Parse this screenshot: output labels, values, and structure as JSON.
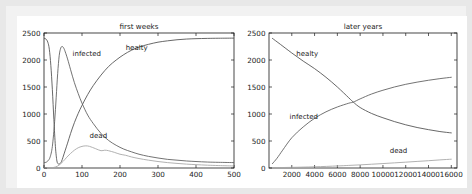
{
  "figure": {
    "background": "#e8e8e8",
    "frame_color": "#f2f2f2",
    "plot_background": "#ffffff"
  },
  "panels": [
    {
      "id": "first-weeks",
      "title": "first weeks",
      "xticks": [
        "0",
        "100",
        "200",
        "300",
        "400",
        "500"
      ],
      "yticks": [
        "0",
        "500",
        "1000",
        "1500",
        "2000",
        "2500"
      ],
      "labels": {
        "healthy": "healty",
        "infected": "infected",
        "dead": "dead"
      }
    },
    {
      "id": "later-years",
      "title": "later years",
      "xticks": [
        "2000",
        "4000",
        "6000",
        "8000",
        "10000",
        "12000",
        "14000",
        "16000"
      ],
      "yticks": [
        "0",
        "500",
        "1000",
        "1500",
        "2000",
        "2500"
      ],
      "labels": {
        "healthy": "healty",
        "infected": "infected",
        "dead": "dead"
      }
    }
  ],
  "chart_data": [
    {
      "type": "line",
      "title": "first weeks",
      "xlabel": "",
      "ylabel": "",
      "xlim": [
        0,
        500
      ],
      "ylim": [
        0,
        2500
      ],
      "grid": false,
      "legend": "inline annotations",
      "xticks": [
        0,
        100,
        200,
        300,
        400,
        500
      ],
      "yticks": [
        0,
        500,
        1000,
        1500,
        2000,
        2500
      ],
      "annotations": [
        {
          "text": "infected",
          "x": 75,
          "y": 2080
        },
        {
          "text": "healty",
          "x": 215,
          "y": 2180
        },
        {
          "text": "dead",
          "x": 120,
          "y": 560
        }
      ],
      "series": [
        {
          "name": "healty",
          "color": "#4d4d4d",
          "x": [
            0,
            5,
            10,
            14,
            18,
            22,
            26,
            30,
            34,
            38,
            42,
            46,
            50,
            56,
            62,
            70,
            80,
            90,
            100,
            115,
            130,
            150,
            170,
            190,
            210,
            230,
            250,
            275,
            300,
            325,
            350,
            375,
            400,
            430,
            460,
            500
          ],
          "y": [
            2400,
            2390,
            2330,
            2200,
            1900,
            1450,
            900,
            400,
            130,
            75,
            80,
            120,
            200,
            330,
            460,
            640,
            840,
            1010,
            1160,
            1360,
            1530,
            1720,
            1880,
            2000,
            2100,
            2180,
            2240,
            2290,
            2330,
            2355,
            2375,
            2388,
            2395,
            2400,
            2403,
            2405
          ]
        },
        {
          "name": "infected",
          "color": "#5a5a5a",
          "x": [
            0,
            5,
            10,
            16,
            22,
            28,
            32,
            36,
            40,
            44,
            48,
            52,
            56,
            62,
            70,
            80,
            90,
            100,
            115,
            130,
            150,
            170,
            190,
            210,
            230,
            250,
            275,
            300,
            325,
            350,
            375,
            400,
            430,
            460,
            500
          ],
          "y": [
            100,
            105,
            130,
            200,
            400,
            860,
            1300,
            1750,
            2080,
            2220,
            2250,
            2220,
            2150,
            2020,
            1820,
            1580,
            1380,
            1200,
            980,
            820,
            640,
            510,
            420,
            350,
            300,
            255,
            215,
            185,
            160,
            145,
            130,
            120,
            110,
            105,
            100
          ]
        },
        {
          "name": "dead",
          "color": "#a8a8a8",
          "x": [
            0,
            10,
            20,
            30,
            40,
            50,
            60,
            70,
            80,
            90,
            100,
            110,
            120,
            135,
            150,
            160,
            170,
            185,
            200,
            215,
            230,
            250,
            275,
            300,
            325,
            350,
            375,
            400,
            430,
            460,
            500
          ],
          "y": [
            0,
            2,
            6,
            18,
            55,
            120,
            200,
            270,
            330,
            375,
            400,
            410,
            400,
            360,
            320,
            330,
            320,
            290,
            255,
            235,
            205,
            175,
            145,
            120,
            100,
            85,
            72,
            62,
            52,
            45,
            38
          ]
        }
      ]
    },
    {
      "type": "line",
      "title": "later years",
      "xlabel": "",
      "ylabel": "",
      "xlim": [
        0,
        16500
      ],
      "ylim": [
        0,
        2500
      ],
      "grid": false,
      "legend": "inline annotations",
      "xticks": [
        2000,
        4000,
        6000,
        8000,
        10000,
        12000,
        14000,
        16000
      ],
      "yticks": [
        0,
        500,
        1000,
        1500,
        2000,
        2500
      ],
      "annotations": [
        {
          "text": "healty",
          "x": 2400,
          "y": 2080
        },
        {
          "text": "infected",
          "x": 1800,
          "y": 900
        },
        {
          "text": "dead",
          "x": 10600,
          "y": 270
        }
      ],
      "series": [
        {
          "name": "healty",
          "color": "#4d4d4d",
          "x": [
            300,
            1000,
            2000,
            3000,
            4000,
            5000,
            6000,
            7000,
            7400,
            8000,
            9000,
            10000,
            11000,
            12000,
            13000,
            14000,
            15000,
            16000
          ],
          "y": [
            2400,
            2290,
            2130,
            1980,
            1840,
            1680,
            1500,
            1300,
            1220,
            1120,
            1010,
            930,
            860,
            800,
            750,
            710,
            675,
            650
          ]
        },
        {
          "name": "infected",
          "color": "#5a5a5a",
          "x": [
            300,
            700,
            1200,
            2000,
            3000,
            4000,
            5000,
            6000,
            7000,
            7400,
            8000,
            9000,
            10000,
            11000,
            12000,
            13000,
            14000,
            15000,
            16000
          ],
          "y": [
            80,
            180,
            330,
            560,
            760,
            920,
            1040,
            1130,
            1200,
            1220,
            1280,
            1370,
            1440,
            1500,
            1550,
            1590,
            1625,
            1655,
            1680
          ]
        },
        {
          "name": "dead",
          "color": "#a8a8a8",
          "x": [
            300,
            2000,
            4000,
            6000,
            7000,
            8000,
            9000,
            10000,
            11000,
            12000,
            13000,
            14000,
            15000,
            16000
          ],
          "y": [
            5,
            12,
            22,
            38,
            48,
            58,
            70,
            82,
            95,
            108,
            122,
            135,
            150,
            163
          ]
        }
      ]
    }
  ]
}
